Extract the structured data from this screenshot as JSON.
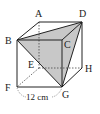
{
  "figure": {
    "type": "cube",
    "shaded_face": "BDG",
    "shade_color": "#c8c8c8",
    "line_color": "#222222",
    "vertices": {
      "A": {
        "label": "A",
        "x": 39,
        "y": 22
      },
      "B": {
        "label": "B",
        "x": 17,
        "y": 40
      },
      "C": {
        "label": "C",
        "x": 62,
        "y": 40
      },
      "D": {
        "label": "D",
        "x": 82,
        "y": 22
      },
      "E": {
        "label": "E",
        "x": 39,
        "y": 68
      },
      "F": {
        "label": "F",
        "x": 17,
        "y": 87
      },
      "G": {
        "label": "G",
        "x": 62,
        "y": 87
      },
      "H": {
        "label": "H",
        "x": 82,
        "y": 68
      }
    },
    "edge_label": "12 cm"
  }
}
